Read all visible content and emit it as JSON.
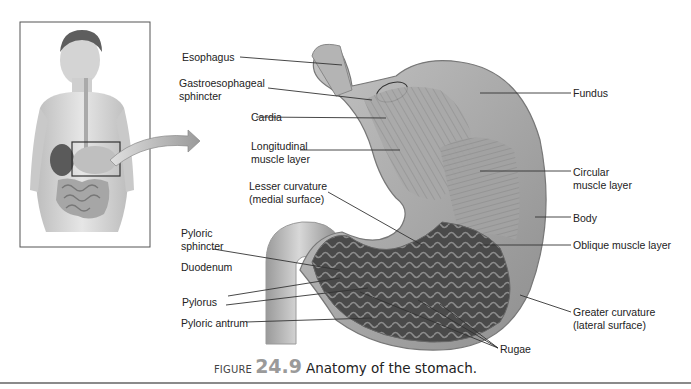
{
  "figure": {
    "prefix": "FIGURE",
    "number": "24.9",
    "title": "Anatomy of the stomach."
  },
  "inset": {
    "description": "Human torso showing location of stomach with callout arrow"
  },
  "labels": {
    "esophagus": "Esophagus",
    "gastroesophageal_1": "Gastroesophageal",
    "gastroesophageal_2": "sphincter",
    "cardia": "Cardia",
    "longitudinal_1": "Longitudinal",
    "longitudinal_2": "muscle layer",
    "lesser_1": "Lesser curvature",
    "lesser_2": "(medial surface)",
    "pyloric_sphincter_1": "Pyloric",
    "pyloric_sphincter_2": "sphincter",
    "duodenum": "Duodenum",
    "pylorus": "Pylorus",
    "pyloric_antrum": "Pyloric antrum",
    "fundus": "Fundus",
    "circular_1": "Circular",
    "circular_2": "muscle layer",
    "body": "Body",
    "oblique": "Oblique muscle layer",
    "greater_1": "Greater curvature",
    "greater_2": "(lateral surface)",
    "rugae": "Rugae"
  },
  "colors": {
    "line": "#333333",
    "caption_number": "#9a9a9a",
    "rule": "#8a8a8a"
  }
}
